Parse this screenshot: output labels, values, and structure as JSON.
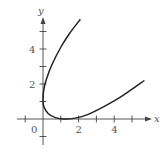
{
  "chart_data": {
    "type": "line",
    "title": "",
    "xlabel": "x",
    "ylabel": "y",
    "xlim": [
      -1.5,
      5.8
    ],
    "ylim": [
      -1,
      6
    ],
    "grid": false,
    "x_ticks": [
      -1,
      1,
      2,
      3,
      4,
      5
    ],
    "y_ticks": [
      -1,
      1,
      2,
      3,
      4,
      5
    ],
    "x_tick_labels": [
      {
        "value": 2,
        "label": "2"
      },
      {
        "value": 4,
        "label": "4"
      }
    ],
    "y_tick_labels": [
      {
        "value": 2,
        "label": "2"
      },
      {
        "value": 4,
        "label": "4"
      }
    ],
    "origin_label": "0",
    "series": [
      {
        "name": "curve",
        "x": [
          2.1,
          1.5,
          1.0,
          0.5,
          0.2,
          0.05,
          0.0,
          0.05,
          0.3,
          0.7,
          1.2,
          1.8,
          2.5,
          3.5,
          4.5,
          5.7
        ],
        "y": [
          5.7,
          4.9,
          4.1,
          3.1,
          2.3,
          1.7,
          1.1,
          0.7,
          0.3,
          0.08,
          0.0,
          0.05,
          0.25,
          0.75,
          1.35,
          2.2
        ]
      }
    ]
  }
}
